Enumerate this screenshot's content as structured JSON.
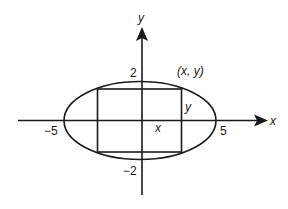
{
  "diagram": {
    "axes": {
      "x_label": "x",
      "y_label": "y"
    },
    "ticks": {
      "x_neg": "−5",
      "x_pos": "5",
      "y_pos": "2",
      "y_neg": "−2"
    },
    "annotations": {
      "corner_point": "(x, y)",
      "half_width": "x",
      "half_height": "y"
    },
    "shapes": {
      "ellipse": {
        "semi_major": 5,
        "semi_minor": 2
      },
      "rectangle": {
        "inscribed": true
      }
    },
    "colors": {
      "stroke": "#1a1a1a",
      "background": "#ffffff"
    }
  }
}
